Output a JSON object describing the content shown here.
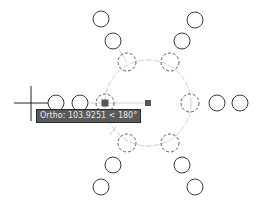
{
  "viewport": {
    "background": "#ffffff"
  },
  "colors": {
    "object_stroke": "#3a3a3a",
    "selected_dashed_stroke": "#5a5a5a",
    "tracking_line": "#c8c8c8",
    "grip_fill": "#555555",
    "cursor": "#222222",
    "tooltip_bg": "#5a5a5a",
    "tooltip_text": "#e8e8e8"
  },
  "tooltip": {
    "text": "Ortho: 103.9251 < 180°",
    "label": "Ortho",
    "distance": "103.9251",
    "angle": "180°"
  },
  "crosshair": {
    "x": 31,
    "y": 103
  },
  "array_center": {
    "x": 148,
    "y": 103,
    "radius": 43
  },
  "circles": [
    {
      "id": "tl-outer",
      "x": 101,
      "y": 19,
      "r": 8,
      "selected": false
    },
    {
      "id": "tl-mid",
      "x": 113,
      "y": 41,
      "r": 8,
      "selected": false
    },
    {
      "id": "tl-inner",
      "x": 127,
      "y": 62,
      "r": 9,
      "selected": true
    },
    {
      "id": "tr-outer",
      "x": 195,
      "y": 20,
      "r": 8,
      "selected": false
    },
    {
      "id": "tr-mid",
      "x": 182,
      "y": 41,
      "r": 8,
      "selected": false
    },
    {
      "id": "tr-inner",
      "x": 170,
      "y": 62,
      "r": 9,
      "selected": true
    },
    {
      "id": "r-inner",
      "x": 190,
      "y": 103,
      "r": 9,
      "selected": true
    },
    {
      "id": "r-mid",
      "x": 217,
      "y": 103,
      "r": 8,
      "selected": false
    },
    {
      "id": "r-outer",
      "x": 240,
      "y": 103,
      "r": 8,
      "selected": false
    },
    {
      "id": "l-inner",
      "x": 105,
      "y": 103,
      "r": 9,
      "selected": true
    },
    {
      "id": "l-mid",
      "x": 80,
      "y": 103,
      "r": 8,
      "selected": false
    },
    {
      "id": "l-outer",
      "x": 56,
      "y": 103,
      "r": 8,
      "selected": false
    },
    {
      "id": "bl-inner",
      "x": 127,
      "y": 143,
      "r": 9,
      "selected": true
    },
    {
      "id": "bl-mid",
      "x": 113,
      "y": 165,
      "r": 8,
      "selected": false
    },
    {
      "id": "bl-outer",
      "x": 101,
      "y": 187,
      "r": 8,
      "selected": false
    },
    {
      "id": "br-inner",
      "x": 170,
      "y": 143,
      "r": 9,
      "selected": true
    },
    {
      "id": "br-mid",
      "x": 182,
      "y": 165,
      "r": 8,
      "selected": false
    },
    {
      "id": "br-outer",
      "x": 195,
      "y": 187,
      "r": 8,
      "selected": false
    }
  ],
  "grips": [
    {
      "id": "center-grip",
      "x": 148,
      "y": 103,
      "size": 6
    },
    {
      "id": "base-grip",
      "x": 105,
      "y": 103,
      "size": 7
    }
  ]
}
